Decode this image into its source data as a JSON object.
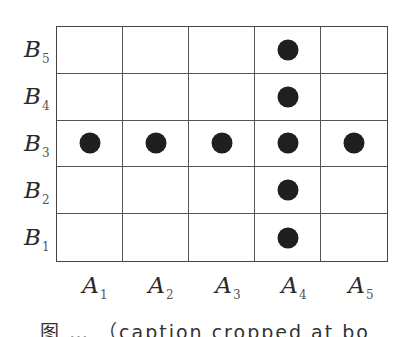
{
  "figure": {
    "type": "grid-diagram",
    "rows": 5,
    "columns": 5,
    "row_labels": [
      {
        "base": "B",
        "sub": "5"
      },
      {
        "base": "B",
        "sub": "4"
      },
      {
        "base": "B",
        "sub": "3"
      },
      {
        "base": "B",
        "sub": "2"
      },
      {
        "base": "B",
        "sub": "1"
      }
    ],
    "column_labels": [
      {
        "base": "A",
        "sub": "1"
      },
      {
        "base": "A",
        "sub": "2"
      },
      {
        "base": "A",
        "sub": "3"
      },
      {
        "base": "A",
        "sub": "4"
      },
      {
        "base": "A",
        "sub": "5"
      }
    ],
    "marked_cells": [
      {
        "col": "A4",
        "row": "B5"
      },
      {
        "col": "A4",
        "row": "B4"
      },
      {
        "col": "A1",
        "row": "B3"
      },
      {
        "col": "A2",
        "row": "B3"
      },
      {
        "col": "A3",
        "row": "B3"
      },
      {
        "col": "A4",
        "row": "B3"
      },
      {
        "col": "A5",
        "row": "B3"
      },
      {
        "col": "A4",
        "row": "B2"
      },
      {
        "col": "A4",
        "row": "B1"
      }
    ],
    "dot_color": "#1f1f1f",
    "grid_line_color": "#555555"
  },
  "caption": {
    "text": "图 … （caption cropped at bottom edge）",
    "visible": "partially-cropped"
  }
}
